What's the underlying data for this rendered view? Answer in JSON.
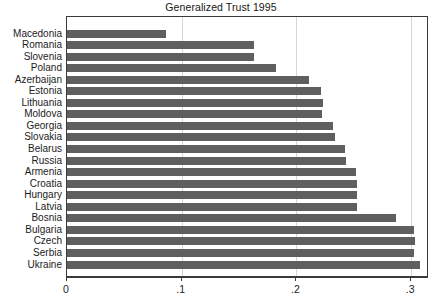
{
  "chart_data": {
    "type": "bar",
    "orientation": "horizontal",
    "title": "Generalized Trust 1995",
    "xlabel": "",
    "ylabel": "",
    "xlim": [
      0,
      0.3155
    ],
    "grid": true,
    "gridlines_axis": "x",
    "legend": null,
    "bar_color": "#5f5f5f",
    "xticks": [
      0,
      0.1,
      0.2,
      0.3
    ],
    "xtick_labels": [
      "0",
      ".1",
      ".2",
      ".3"
    ],
    "categories": [
      "Macedonia",
      "Romania",
      "Slovenia",
      "Poland",
      "Azerbaijan",
      "Estonia",
      "Lithuania",
      "Moldova",
      "Georgia",
      "Slovakia",
      "Belarus",
      "Russia",
      "Armenia",
      "Croatia",
      "Hungary",
      "Latvia",
      "Bosnia",
      "Bulgaria",
      "Czech",
      "Serbia",
      "Ukraine"
    ],
    "values": [
      0.086,
      0.163,
      0.163,
      0.182,
      0.211,
      0.221,
      0.223,
      0.222,
      0.232,
      0.234,
      0.242,
      0.243,
      0.252,
      0.253,
      0.253,
      0.253,
      0.287,
      0.302,
      0.303,
      0.302,
      0.308
    ]
  }
}
